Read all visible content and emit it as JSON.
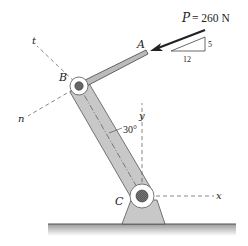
{
  "diagram": {
    "type": "mechanics-free-body",
    "force": {
      "symbol": "P",
      "equals": "= 260 N",
      "label": "P = 260 N",
      "magnitude": 260,
      "unit": "N"
    },
    "slope_triangle": {
      "rise": "5",
      "run": "12"
    },
    "points": {
      "A": "A",
      "B": "B",
      "C": "C"
    },
    "axes": {
      "x": "x",
      "y": "y",
      "t": "t",
      "n": "n"
    },
    "angle": {
      "label": "30°",
      "value": 30
    },
    "colors": {
      "member_fill": "#c8c8c8",
      "member_stroke": "#555555",
      "pin_fill": "#666666",
      "ground": "#888888",
      "dash": "#555555",
      "arrow": "#222222"
    }
  }
}
